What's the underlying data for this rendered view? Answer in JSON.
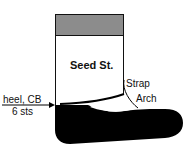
{
  "diagram": {
    "title_label": "Seed St.",
    "strap_label": "Strap",
    "arch_label": "Arch",
    "heel_label_line1": "heel, CB",
    "heel_label_line2": "6 sts",
    "colors": {
      "cuff": "#8c8c8c",
      "foot": "#000000",
      "leg": "#ffffff",
      "outline": "#111111"
    }
  }
}
